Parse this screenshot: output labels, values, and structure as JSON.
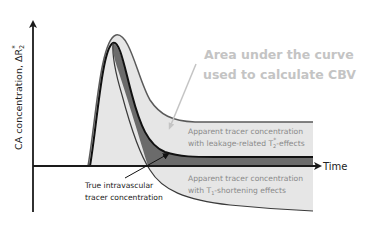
{
  "diagram": {
    "y_axis_label": "CA concentration, ΔR",
    "y_axis_label_sub": "2",
    "y_axis_label_sup": "*",
    "x_axis_label": "Time",
    "cbv_annotation_line1": "Area under the curve",
    "cbv_annotation_line2": "used to calculate CBV",
    "leakage_label_line1": "Apparent tracer concentration",
    "leakage_label_line2_pre": "with leakage-related T",
    "leakage_label_line2_sub": "2",
    "leakage_label_line2_sup": "*",
    "leakage_label_line2_post": "-effects",
    "t1_label_line1": "Apparent tracer concentration",
    "t1_label_line2_pre": "with T",
    "t1_label_line2_sub": "1",
    "t1_label_line2_post": "-shortening effects",
    "true_label_line1": "True intravascular",
    "true_label_line2": "tracer concentration",
    "colors": {
      "axis": "#1a1a1a",
      "true_curve_stroke": "#111111",
      "dark_band": "#6b6b6b",
      "light_fill": "#e4e4e4",
      "outer_stroke": "#555555",
      "annotation_gray": "#c4c4c4",
      "label_gray": "#8a8a8a"
    }
  }
}
